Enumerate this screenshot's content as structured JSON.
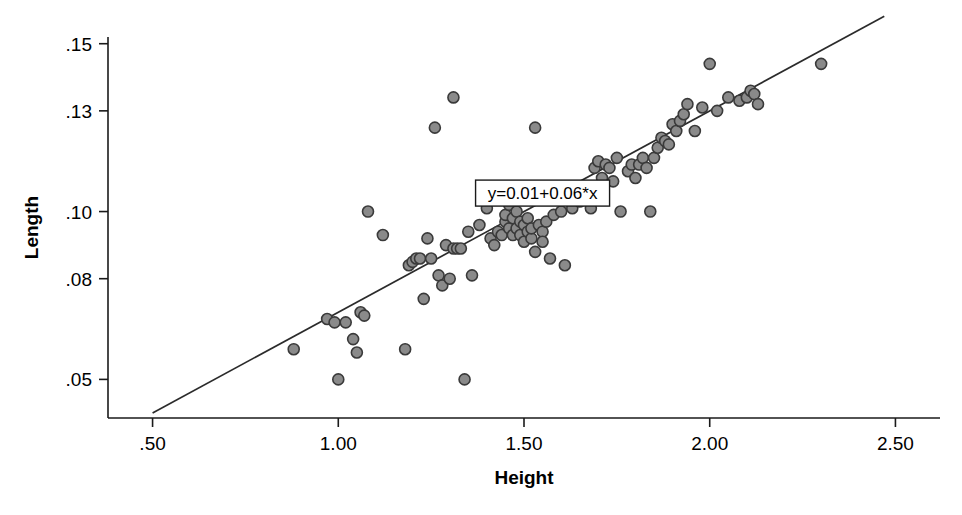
{
  "chart_data": {
    "type": "scatter",
    "title": "",
    "subtitle": "",
    "xlabel": "Height",
    "ylabel": "Length",
    "xlim": [
      0.38,
      2.62
    ],
    "ylim": [
      0.0385,
      0.152
    ],
    "grid": false,
    "legend": null,
    "xticks": [
      0.5,
      1.0,
      1.5,
      2.0,
      2.5
    ],
    "xticklabels": [
      ".50",
      "1.00",
      "1.50",
      "2.00",
      "2.50"
    ],
    "yticks": [
      0.05,
      0.08,
      0.1,
      0.13,
      0.15
    ],
    "yticklabels": [
      ".05",
      ".08",
      ".10",
      ".13",
      ".15"
    ],
    "annotations": [
      {
        "text": "y=0.01+0.06*x",
        "x": 1.55,
        "y": 0.1055,
        "boxed": true
      }
    ],
    "fit_line": {
      "intercept": 0.01,
      "slope": 0.06,
      "equation": "y=0.01+0.06*x",
      "x_start": 0.5,
      "x_end": 2.47
    },
    "marker": {
      "shape": "circle",
      "fill_color": "#8a8a8a",
      "edge_color": "#3a3a3a",
      "size_px": 11
    },
    "x": [
      0.88,
      0.97,
      0.99,
      1.0,
      1.02,
      1.04,
      1.05,
      1.06,
      1.07,
      1.08,
      1.12,
      1.18,
      1.19,
      1.2,
      1.21,
      1.22,
      1.23,
      1.24,
      1.25,
      1.26,
      1.27,
      1.28,
      1.29,
      1.3,
      1.31,
      1.31,
      1.32,
      1.33,
      1.34,
      1.35,
      1.36,
      1.38,
      1.4,
      1.41,
      1.42,
      1.43,
      1.44,
      1.45,
      1.45,
      1.46,
      1.46,
      1.47,
      1.47,
      1.48,
      1.48,
      1.49,
      1.49,
      1.5,
      1.5,
      1.51,
      1.51,
      1.52,
      1.52,
      1.53,
      1.53,
      1.54,
      1.55,
      1.55,
      1.56,
      1.57,
      1.58,
      1.6,
      1.61,
      1.63,
      1.65,
      1.68,
      1.69,
      1.7,
      1.71,
      1.72,
      1.73,
      1.74,
      1.75,
      1.76,
      1.78,
      1.79,
      1.8,
      1.81,
      1.82,
      1.83,
      1.84,
      1.85,
      1.86,
      1.87,
      1.88,
      1.89,
      1.9,
      1.91,
      1.92,
      1.93,
      1.94,
      1.96,
      1.98,
      2.0,
      2.02,
      2.05,
      2.08,
      2.1,
      2.11,
      2.12,
      2.13,
      2.3
    ],
    "y": [
      0.059,
      0.068,
      0.067,
      0.05,
      0.067,
      0.062,
      0.058,
      0.07,
      0.069,
      0.1,
      0.093,
      0.059,
      0.084,
      0.085,
      0.086,
      0.086,
      0.074,
      0.092,
      0.086,
      0.125,
      0.081,
      0.078,
      0.09,
      0.08,
      0.089,
      0.134,
      0.089,
      0.089,
      0.05,
      0.094,
      0.081,
      0.096,
      0.101,
      0.092,
      0.09,
      0.094,
      0.093,
      0.097,
      0.099,
      0.095,
      0.102,
      0.093,
      0.098,
      0.095,
      0.1,
      0.093,
      0.097,
      0.091,
      0.096,
      0.094,
      0.098,
      0.092,
      0.095,
      0.088,
      0.125,
      0.096,
      0.094,
      0.091,
      0.097,
      0.086,
      0.099,
      0.1,
      0.084,
      0.101,
      0.103,
      0.101,
      0.113,
      0.115,
      0.11,
      0.114,
      0.113,
      0.109,
      0.116,
      0.1,
      0.112,
      0.114,
      0.11,
      0.114,
      0.116,
      0.113,
      0.1,
      0.116,
      0.119,
      0.122,
      0.121,
      0.12,
      0.126,
      0.124,
      0.127,
      0.129,
      0.132,
      0.124,
      0.131,
      0.144,
      0.13,
      0.134,
      0.133,
      0.134,
      0.136,
      0.135,
      0.132,
      0.144
    ]
  }
}
